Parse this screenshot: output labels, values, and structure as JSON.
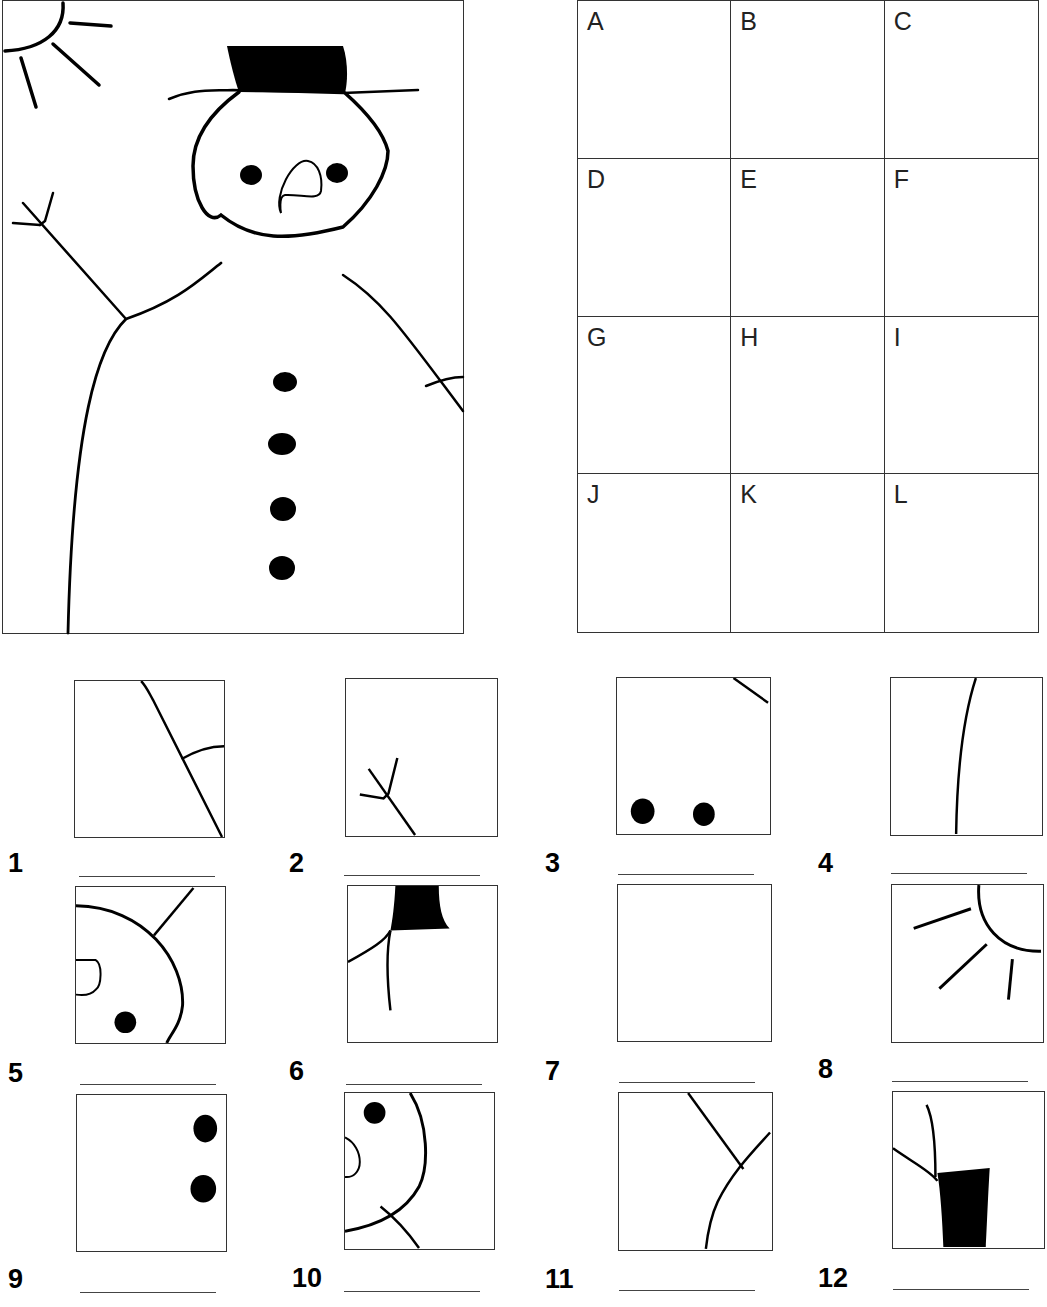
{
  "picture": {
    "subject": "snowman",
    "elements": [
      "sun-icon",
      "top-hat-icon",
      "snowman-head",
      "eyes",
      "nose",
      "stick-arm-left",
      "stick-arm-right",
      "body",
      "buttons"
    ],
    "button_count": 4
  },
  "grid": {
    "rows": 4,
    "columns": 3,
    "cells": [
      "A",
      "B",
      "C",
      "D",
      "E",
      "F",
      "G",
      "H",
      "I",
      "J",
      "K",
      "L"
    ]
  },
  "pieces": [
    {
      "number": "1",
      "answer": ""
    },
    {
      "number": "2",
      "answer": ""
    },
    {
      "number": "3",
      "answer": ""
    },
    {
      "number": "4",
      "answer": ""
    },
    {
      "number": "5",
      "answer": ""
    },
    {
      "number": "6",
      "answer": ""
    },
    {
      "number": "7",
      "answer": ""
    },
    {
      "number": "8",
      "answer": ""
    },
    {
      "number": "9",
      "answer": ""
    },
    {
      "number": "10",
      "answer": ""
    },
    {
      "number": "11",
      "answer": ""
    },
    {
      "number": "12",
      "answer": ""
    }
  ],
  "colors": {
    "ink": "#000000",
    "frame": "#333333",
    "paper": "#ffffff"
  }
}
